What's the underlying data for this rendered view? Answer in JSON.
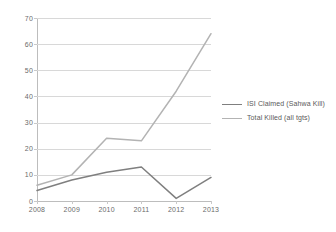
{
  "chart_data": {
    "type": "line",
    "title": "",
    "subtitle": "",
    "xlabel": "",
    "ylabel": "",
    "categories": [
      "2008",
      "2009",
      "2010",
      "2011",
      "2012",
      "2013"
    ],
    "series": [
      {
        "name": "ISI Claimed (Sahwa Kill)",
        "color": "#7f7f7f",
        "values": [
          4,
          8,
          11,
          13,
          1,
          9
        ]
      },
      {
        "name": "Total Killed    (all tgts)",
        "color": "#b3b3b3",
        "values": [
          6,
          10,
          24,
          23,
          42,
          64
        ]
      }
    ],
    "ylim": [
      0,
      70
    ],
    "ytick_step": 10,
    "yticks": [
      "70",
      "60",
      "50",
      "40",
      "30",
      "20",
      "10",
      "0"
    ],
    "grid": true,
    "grid_color": "#d8d8d8",
    "legend_position": "right",
    "background": "#ffffff",
    "axis_color": "#bdbdbd",
    "tick_label_color": "#6b6b6b"
  },
  "legend": {
    "entries": [
      {
        "label": "ISI Claimed (Sahwa Kill)"
      },
      {
        "label": "Total Killed    (all tgts)"
      }
    ]
  }
}
